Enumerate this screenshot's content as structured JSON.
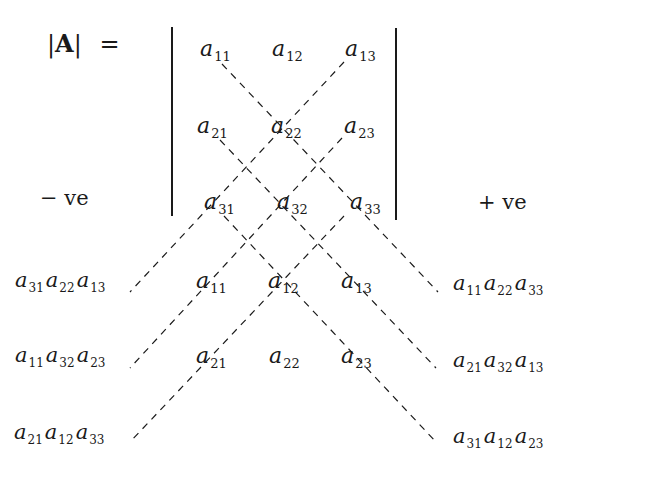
{
  "title": {
    "bar_left": "|",
    "symbol": "A",
    "bar_right": "|",
    "equals": "="
  },
  "labels": {
    "negative": "− ve",
    "positive": "+ ve"
  },
  "matrix": [
    [
      {
        "base": "a",
        "sub": "11"
      },
      {
        "base": "a",
        "sub": "12"
      },
      {
        "base": "a",
        "sub": "13"
      }
    ],
    [
      {
        "base": "a",
        "sub": "21"
      },
      {
        "base": "a",
        "sub": "22"
      },
      {
        "base": "a",
        "sub": "23"
      }
    ],
    [
      {
        "base": "a",
        "sub": "31"
      },
      {
        "base": "a",
        "sub": "32"
      },
      {
        "base": "a",
        "sub": "33"
      }
    ]
  ],
  "repeated_rows": [
    [
      {
        "base": "a",
        "sub": "11"
      },
      {
        "base": "a",
        "sub": "12"
      },
      {
        "base": "a",
        "sub": "13"
      }
    ],
    [
      {
        "base": "a",
        "sub": "21"
      },
      {
        "base": "a",
        "sub": "22"
      },
      {
        "base": "a",
        "sub": "23"
      }
    ]
  ],
  "negative_products": [
    [
      {
        "base": "a",
        "sub": "31"
      },
      {
        "base": "a",
        "sub": "22"
      },
      {
        "base": "a",
        "sub": "13"
      }
    ],
    [
      {
        "base": "a",
        "sub": "11"
      },
      {
        "base": "a",
        "sub": "32"
      },
      {
        "base": "a",
        "sub": "23"
      }
    ],
    [
      {
        "base": "a",
        "sub": "21"
      },
      {
        "base": "a",
        "sub": "12"
      },
      {
        "base": "a",
        "sub": "33"
      }
    ]
  ],
  "positive_products": [
    [
      {
        "base": "a",
        "sub": "11"
      },
      {
        "base": "a",
        "sub": "22"
      },
      {
        "base": "a",
        "sub": "33"
      }
    ],
    [
      {
        "base": "a",
        "sub": "21"
      },
      {
        "base": "a",
        "sub": "32"
      },
      {
        "base": "a",
        "sub": "13"
      }
    ],
    [
      {
        "base": "a",
        "sub": "31"
      },
      {
        "base": "a",
        "sub": "12"
      },
      {
        "base": "a",
        "sub": "23"
      }
    ]
  ],
  "colors": {
    "ink": "#1a1a1a",
    "background": "#ffffff"
  }
}
